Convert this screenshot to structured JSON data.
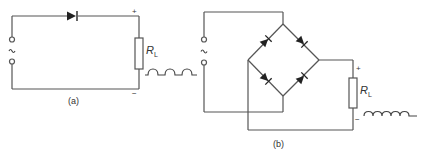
{
  "colors": {
    "wire": "#555555",
    "diode": "#222222",
    "background": "#ffffff"
  },
  "circuit_a": {
    "caption": "(a)",
    "source_symbol": "~",
    "load_label_main": "R",
    "load_label_sub": "L",
    "plus": "+",
    "minus": "−",
    "waveform": "half-wave rectified"
  },
  "circuit_b": {
    "caption": "(b)",
    "source_symbol": "~",
    "load_label_main": "R",
    "load_label_sub": "L",
    "plus": "+",
    "minus": "−",
    "waveform": "full-wave rectified"
  }
}
